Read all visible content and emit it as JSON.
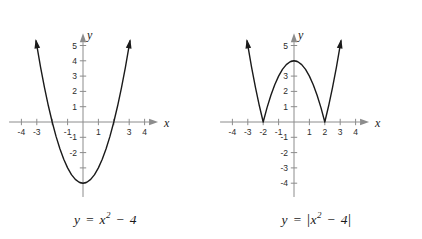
{
  "figure": {
    "background_color": "#ffffff",
    "curve_color": "#1a1a1a",
    "axis_color": "#8c8c8c",
    "tick_label_color": "#2b2b2b"
  },
  "chart_data": [
    {
      "type": "line",
      "title": "",
      "equation": "y = x^2 - 4",
      "caption_parts": {
        "lhs": "y",
        "eq": "=",
        "base": "x",
        "exp": "2",
        "minus": "−",
        "const": "4"
      },
      "xlabel": "x",
      "ylabel": "y",
      "xlim": [
        -4.8,
        5.2
      ],
      "ylim": [
        -4.9,
        6.0
      ],
      "grid": false,
      "legend": "none",
      "x_ticks": [
        -4,
        -3,
        -2,
        -1,
        1,
        2,
        3,
        4
      ],
      "x_tick_labels_visible": [
        "-4",
        "-3",
        "-1",
        "1",
        "3",
        "4"
      ],
      "y_ticks": [
        -4,
        -3,
        -2,
        -1,
        1,
        2,
        3,
        4,
        5
      ],
      "y_tick_labels_visible": [
        "5",
        "4",
        "3",
        "2",
        "1",
        "-1",
        "-2"
      ],
      "vertex": {
        "x": 0,
        "y": -4
      },
      "roots": [
        -2,
        2
      ],
      "x": [
        -3.05,
        -2.75,
        -2.5,
        -2.25,
        -2,
        -1.75,
        -1.5,
        -1.25,
        -1,
        -0.75,
        -0.5,
        -0.25,
        0,
        0.25,
        0.5,
        0.75,
        1,
        1.25,
        1.5,
        1.75,
        2,
        2.25,
        2.5,
        2.75,
        3.05
      ],
      "y": [
        5.3,
        3.56,
        2.25,
        1.06,
        0,
        -0.94,
        -1.75,
        -2.44,
        -3,
        -3.44,
        -3.75,
        -3.94,
        -4,
        -3.94,
        -3.75,
        -3.44,
        -3,
        -2.44,
        -1.75,
        -0.94,
        0,
        1.06,
        2.25,
        3.56,
        5.3
      ],
      "arrow_ends": [
        "left-arm-up",
        "right-arm-up"
      ]
    },
    {
      "type": "line",
      "title": "",
      "equation": "y = |x^2 - 4|",
      "caption_parts": {
        "lhs": "y",
        "eq": "=",
        "base": "x",
        "exp": "2",
        "minus": "−",
        "const": "4",
        "bar": "|"
      },
      "xlabel": "x",
      "ylabel": "y",
      "xlim": [
        -4.8,
        5.2
      ],
      "ylim": [
        -4.9,
        6.0
      ],
      "grid": false,
      "legend": "none",
      "x_ticks": [
        -4,
        -3,
        -2,
        -1,
        1,
        2,
        3,
        4
      ],
      "x_tick_labels_visible": [
        "-4",
        "-3",
        "-2",
        "-1",
        "1",
        "2",
        "3",
        "4"
      ],
      "y_ticks": [
        -4,
        -3,
        -2,
        -1,
        1,
        2,
        3,
        4,
        5
      ],
      "y_tick_labels_visible": [
        "5",
        "3",
        "2",
        "1",
        "-1",
        "-2",
        "-3",
        "-4"
      ],
      "peak": {
        "x": 0,
        "y": 4
      },
      "cusps": [
        -2,
        2
      ],
      "x": [
        -3.05,
        -2.75,
        -2.5,
        -2.25,
        -2,
        -1.75,
        -1.5,
        -1.25,
        -1,
        -0.75,
        -0.5,
        -0.25,
        0,
        0.25,
        0.5,
        0.75,
        1,
        1.25,
        1.5,
        1.75,
        2,
        2.25,
        2.5,
        2.75,
        3.05
      ],
      "y": [
        5.3,
        3.56,
        2.25,
        1.06,
        0,
        0.94,
        1.75,
        2.44,
        3,
        3.44,
        3.75,
        3.94,
        4,
        3.94,
        3.75,
        3.44,
        3,
        2.44,
        1.75,
        0.94,
        0,
        1.06,
        2.25,
        3.56,
        5.3
      ],
      "arrow_ends": [
        "left-arm-up",
        "right-arm-up"
      ]
    }
  ],
  "panels": {
    "left": {
      "name": "parabola-panel",
      "axis_x_label": "x",
      "axis_y_label": "y",
      "ticks_x": [
        {
          "value": -4,
          "label": "-4",
          "visible": true
        },
        {
          "value": -3,
          "label": "-3",
          "visible": true
        },
        {
          "value": -2,
          "label": "-2",
          "visible": false
        },
        {
          "value": -1,
          "label": "-1",
          "visible": true
        },
        {
          "value": 1,
          "label": "1",
          "visible": true
        },
        {
          "value": 2,
          "label": "2",
          "visible": false
        },
        {
          "value": 3,
          "label": "3",
          "visible": true
        },
        {
          "value": 4,
          "label": "4",
          "visible": true
        }
      ],
      "ticks_y": [
        {
          "value": 5,
          "label": "5",
          "visible": true
        },
        {
          "value": 4,
          "label": "4",
          "visible": true
        },
        {
          "value": 3,
          "label": "3",
          "visible": true
        },
        {
          "value": 2,
          "label": "2",
          "visible": true
        },
        {
          "value": 1,
          "label": "1",
          "visible": true
        },
        {
          "value": -1,
          "label": "-1",
          "visible": true
        },
        {
          "value": -2,
          "label": "-2",
          "visible": true
        },
        {
          "value": -3,
          "label": "-3",
          "visible": false
        },
        {
          "value": -4,
          "label": "-4",
          "visible": false
        }
      ]
    },
    "right": {
      "name": "absolute-value-panel",
      "axis_x_label": "x",
      "axis_y_label": "y",
      "ticks_x": [
        {
          "value": -4,
          "label": "-4",
          "visible": true
        },
        {
          "value": -3,
          "label": "-3",
          "visible": true
        },
        {
          "value": -2,
          "label": "-2",
          "visible": true
        },
        {
          "value": -1,
          "label": "-1",
          "visible": true
        },
        {
          "value": 1,
          "label": "1",
          "visible": true
        },
        {
          "value": 2,
          "label": "2",
          "visible": true
        },
        {
          "value": 3,
          "label": "3",
          "visible": true
        },
        {
          "value": 4,
          "label": "4",
          "visible": true
        }
      ],
      "ticks_y": [
        {
          "value": 5,
          "label": "5",
          "visible": true
        },
        {
          "value": 4,
          "label": "4",
          "visible": false
        },
        {
          "value": 3,
          "label": "3",
          "visible": true
        },
        {
          "value": 2,
          "label": "2",
          "visible": true
        },
        {
          "value": 1,
          "label": "1",
          "visible": true
        },
        {
          "value": -1,
          "label": "-1",
          "visible": true
        },
        {
          "value": -2,
          "label": "-2",
          "visible": true
        },
        {
          "value": -3,
          "label": "-3",
          "visible": true
        },
        {
          "value": -4,
          "label": "-4",
          "visible": true
        }
      ]
    }
  }
}
